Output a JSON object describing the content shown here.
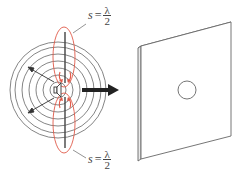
{
  "diagram": {
    "labels": {
      "top": {
        "var": "s",
        "eq": "=",
        "num": "λ",
        "den": "2"
      },
      "bottom": {
        "var": "s",
        "eq": "=",
        "num": "λ",
        "den": "2"
      }
    },
    "colors": {
      "lines": "#555555",
      "lobes": "#e05a4a",
      "arrow": "#222222",
      "panel": "#666666"
    },
    "source": {
      "cx": 58,
      "cy": 90
    },
    "wavefront_radii": [
      8,
      15,
      22,
      29,
      36,
      43,
      48
    ]
  }
}
